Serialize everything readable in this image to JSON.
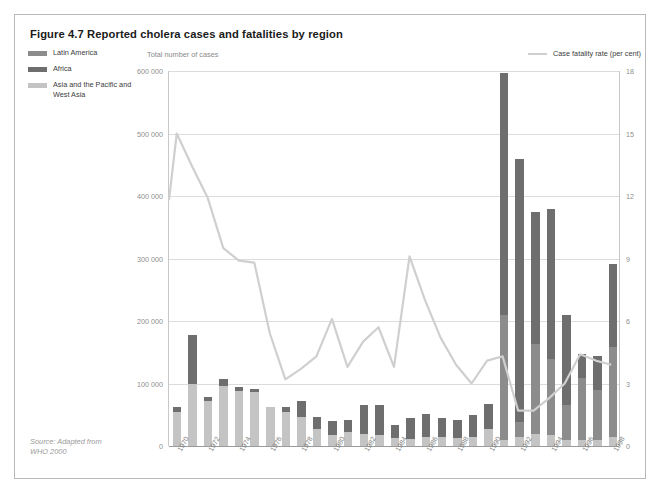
{
  "figure": {
    "title": "Figure 4.7 Reported cholera cases and fatalities by region",
    "source_line1": "Source: Adapted from",
    "source_line2": "WHO 2000"
  },
  "legend_left": {
    "items": [
      {
        "label": "Latin America",
        "color": "#8c8c8c"
      },
      {
        "label": "Africa",
        "color": "#6e6e6e"
      },
      {
        "label": "Asia and the Pacific and West Asia",
        "color": "#c4c4c4"
      }
    ]
  },
  "legend_right": {
    "label": "Case fatality rate (per cent)",
    "color": "#cfcfcf"
  },
  "axis_caption": {
    "left": "Total number of cases"
  },
  "chart_data": {
    "type": "bar",
    "title": "Figure 4.7 Reported cholera cases and fatalities by region",
    "xlabel": "",
    "ylabel": "Total number of cases",
    "y2label": "Case fatality rate (per cent)",
    "ylim": [
      0,
      600000
    ],
    "y2lim": [
      0,
      18
    ],
    "yticks": [
      0,
      100000,
      200000,
      300000,
      400000,
      500000,
      600000
    ],
    "ytick_labels": [
      "0",
      "100 000",
      "200 000",
      "300 000",
      "400 000",
      "500 000",
      "600 000"
    ],
    "y2ticks": [
      0,
      3,
      6,
      9,
      12,
      15,
      18
    ],
    "y2tick_labels": [
      "0",
      "3",
      "6",
      "9",
      "12",
      "15",
      "18"
    ],
    "grid": true,
    "legend_position": "top",
    "stacked": true,
    "categories": [
      "1970",
      "1971",
      "1972",
      "1973",
      "1974",
      "1975",
      "1976",
      "1977",
      "1978",
      "1979",
      "1980",
      "1981",
      "1982",
      "1983",
      "1984",
      "1985",
      "1986",
      "1987",
      "1988",
      "1989",
      "1990",
      "1991",
      "1992",
      "1993",
      "1994",
      "1995",
      "1996",
      "1997",
      "1998"
    ],
    "xtick_labels": [
      "1970",
      "1972",
      "1974",
      "1976",
      "1978",
      "1980",
      "1982",
      "1984",
      "1986",
      "1988",
      "1990",
      "1992",
      "1994",
      "1996",
      "1998"
    ],
    "series": [
      {
        "name": "Asia and the Pacific and West Asia",
        "color": "#c4c4c4",
        "values": [
          55000,
          100000,
          72000,
          96000,
          88000,
          86000,
          63000,
          55000,
          47000,
          28000,
          18000,
          22000,
          20000,
          18000,
          13000,
          12000,
          15000,
          14000,
          13000,
          14000,
          27000,
          10000,
          14000,
          20000,
          17000,
          10000,
          9000,
          9000,
          14000
        ]
      },
      {
        "name": "Latin America",
        "color": "#8c8c8c",
        "values": [
          0,
          0,
          0,
          0,
          0,
          0,
          0,
          0,
          0,
          0,
          0,
          0,
          0,
          0,
          0,
          0,
          0,
          0,
          0,
          0,
          0,
          200000,
          25000,
          143000,
          123000,
          55000,
          100000,
          80000,
          145000
        ]
      },
      {
        "name": "Africa",
        "color": "#6e6e6e",
        "values": [
          8000,
          78000,
          6000,
          12000,
          6000,
          6000,
          0,
          8000,
          25000,
          19000,
          22000,
          20000,
          45000,
          47000,
          20000,
          33000,
          37000,
          31000,
          28000,
          36000,
          40000,
          387000,
          421000,
          212000,
          240000,
          144000,
          39000,
          55000,
          133000
        ]
      }
    ],
    "line_series": {
      "name": "Case fatality rate (per cent)",
      "color": "#cfcfcf",
      "axis": "right",
      "values": [
        11.8,
        15.0,
        13.4,
        11.9,
        9.5,
        8.9,
        8.8,
        5.4,
        3.2,
        3.7,
        4.3,
        6.1,
        3.8,
        5.0,
        5.7,
        3.8,
        9.1,
        7.0,
        5.2,
        3.9,
        3.0,
        4.1,
        4.3,
        1.7,
        1.7,
        2.3,
        3.0,
        4.4,
        4.1,
        3.9
      ]
    }
  }
}
